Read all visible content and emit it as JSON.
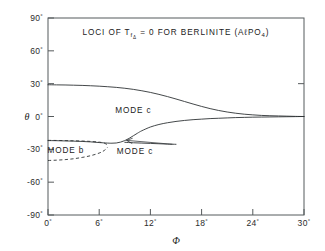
{
  "figure": {
    "title_parts": {
      "lead": "LOCI OF T",
      "sub": "f",
      "subsub": "Δ",
      "mid": " = 0  FOR  BERLINITE  (A",
      "script_l": "ℓ",
      "formula": "PO",
      "formula_sub": "4",
      "tail": ")"
    },
    "title_plain": "LOCI OF TfΔ = 0 FOR BERLINITE (AℓPO4)",
    "annotations": [
      {
        "id": "mode-c-upper",
        "label": "MODE  c",
        "x_deg": 10.0,
        "y_deg": 6.0
      },
      {
        "id": "mode-b",
        "label": "MODE  b",
        "x_deg": 2.1,
        "y_deg": -30.5
      },
      {
        "id": "mode-c-lower",
        "label": "MODE  c",
        "x_deg": 10.2,
        "y_deg": -31.5
      }
    ],
    "leader_line": {
      "id": "mode-c-lower-arrow",
      "from_x_deg": 14.6,
      "from_y_deg": -25.4,
      "to_x_deg": 9.2,
      "to_y_deg": -21.8
    },
    "colors": {
      "axis": "#555a5c",
      "curve": "#2f3335",
      "text": "#1a1a1a",
      "background": "#ffffff"
    }
  },
  "chart_data": {
    "type": "line",
    "title": "LOCI OF TfΔ = 0 FOR BERLINITE (AℓPO4)",
    "xlabel": "Φ",
    "ylabel": "θ",
    "xlim": [
      0,
      30
    ],
    "ylim": [
      -90,
      90
    ],
    "xticks": [
      0,
      6,
      12,
      18,
      24,
      30
    ],
    "xtick_labels": [
      "0°",
      "6°",
      "12°",
      "18°",
      "24°",
      "30°"
    ],
    "yticks": [
      -90,
      -60,
      -30,
      0,
      30,
      60,
      90
    ],
    "ytick_labels": [
      "-90°",
      "-60°",
      "-30°",
      "0°",
      "30°",
      "60°",
      "90°"
    ],
    "grid": false,
    "legend": "none",
    "units": "degrees",
    "series": [
      {
        "name": "MODE c (upper branch)",
        "style": "solid",
        "x": [
          0,
          1,
          2,
          3,
          4,
          5,
          6,
          7,
          8,
          9,
          10,
          11,
          12,
          13,
          14,
          15,
          16,
          17,
          18,
          19,
          20,
          21,
          22,
          23,
          24,
          25,
          26,
          27,
          28,
          29,
          30
        ],
        "y": [
          29.0,
          28.9,
          28.8,
          28.6,
          28.4,
          28.1,
          27.7,
          27.2,
          26.6,
          25.8,
          24.8,
          23.5,
          22.0,
          20.2,
          18.2,
          16.0,
          13.7,
          11.4,
          9.2,
          7.2,
          5.5,
          4.1,
          3.0,
          2.1,
          1.5,
          1.0,
          0.7,
          0.5,
          0.3,
          0.1,
          0.0
        ]
      },
      {
        "name": "MODE c (lower branch)",
        "style": "solid",
        "x": [
          0,
          1,
          2,
          3,
          4,
          5,
          6,
          7,
          7.5,
          8,
          8.5,
          9,
          9.5,
          10,
          10.5,
          11,
          12,
          13,
          14,
          15,
          16,
          17,
          18,
          19,
          20,
          21,
          22,
          23,
          24,
          25,
          26,
          27,
          28,
          29,
          30
        ],
        "y": [
          -22.0,
          -22.1,
          -22.3,
          -22.5,
          -22.8,
          -23.2,
          -23.8,
          -24.3,
          -24.4,
          -24.2,
          -23.4,
          -22.0,
          -20.0,
          -17.6,
          -15.2,
          -13.0,
          -9.6,
          -7.3,
          -5.7,
          -4.5,
          -3.6,
          -2.9,
          -2.4,
          -1.9,
          -1.6,
          -1.3,
          -1.0,
          -0.8,
          -0.6,
          -0.5,
          -0.4,
          -0.3,
          -0.2,
          -0.1,
          0.0
        ]
      },
      {
        "name": "MODE c (near-flat arrowed branch)",
        "style": "solid",
        "x": [
          9.0,
          10.0,
          11.0,
          12.0,
          13.0,
          14.0,
          15.0
        ],
        "y": [
          -23.6,
          -24.0,
          -24.3,
          -24.6,
          -24.9,
          -25.2,
          -25.4
        ]
      },
      {
        "name": "MODE b (upper dashed)",
        "style": "dashed",
        "x": [
          0,
          1,
          2,
          3,
          4,
          5,
          6,
          6.6,
          7.0
        ],
        "y": [
          -21.8,
          -21.9,
          -22.0,
          -22.2,
          -22.4,
          -22.8,
          -23.4,
          -24.4,
          -26.0
        ]
      },
      {
        "name": "MODE b (lower dashed)",
        "style": "dashed",
        "x": [
          0,
          1,
          2,
          3,
          4,
          5,
          6,
          6.6,
          7.0
        ],
        "y": [
          -40.2,
          -39.9,
          -39.4,
          -38.6,
          -37.4,
          -35.8,
          -33.4,
          -31.0,
          -28.0
        ]
      }
    ]
  }
}
